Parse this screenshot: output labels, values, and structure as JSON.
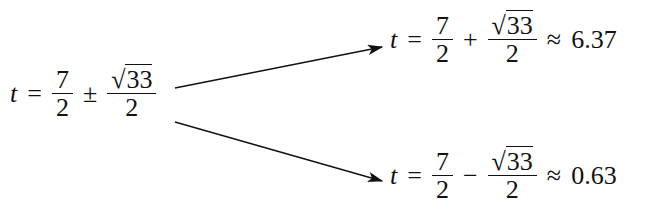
{
  "main": {
    "variable": "t",
    "equals": "=",
    "base_num": "7",
    "base_den": "2",
    "pm": "±",
    "sqrt_sign": "√",
    "radicand": "33",
    "den": "2"
  },
  "upper": {
    "variable": "t",
    "equals": "=",
    "base_num": "7",
    "base_den": "2",
    "op": "+",
    "sqrt_sign": "√",
    "radicand": "33",
    "den": "2",
    "approx": "≈",
    "value": "6.37"
  },
  "lower": {
    "variable": "t",
    "equals": "=",
    "base_num": "7",
    "base_den": "2",
    "op": "−",
    "sqrt_sign": "√",
    "radicand": "33",
    "den": "2",
    "approx": "≈",
    "value": "0.63"
  }
}
